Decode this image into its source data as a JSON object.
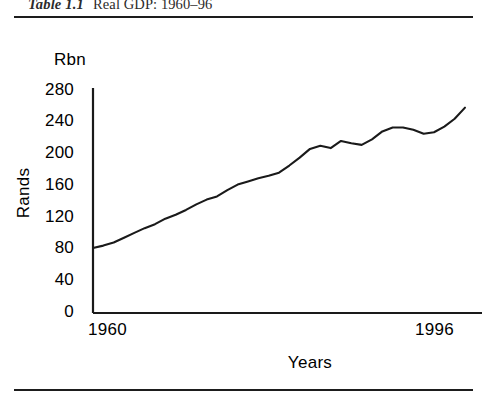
{
  "caption": {
    "label": "Table 1.1",
    "title": "Real GDP: 1960–96"
  },
  "chart_data": {
    "type": "line",
    "title": "Real GDP: 1960–96",
    "unit_label": "Rbn",
    "xlabel": "Years",
    "ylabel": "Rands",
    "xlim": [
      1960,
      1996
    ],
    "ylim": [
      0,
      280
    ],
    "yticks": [
      0,
      40,
      80,
      120,
      160,
      200,
      240,
      280
    ],
    "xticks": [
      1960,
      1996
    ],
    "xtick_labels": [
      "1960",
      "1996"
    ],
    "grid": false,
    "legend": false,
    "series": [
      {
        "name": "Real GDP",
        "color": "#1a1a1a",
        "x": [
          1960,
          1961,
          1962,
          1963,
          1964,
          1965,
          1966,
          1967,
          1968,
          1969,
          1970,
          1971,
          1972,
          1973,
          1974,
          1975,
          1976,
          1977,
          1978,
          1979,
          1980,
          1981,
          1982,
          1983,
          1984,
          1985,
          1986,
          1987,
          1988,
          1989,
          1990,
          1991,
          1992,
          1993,
          1994,
          1995,
          1996
        ],
        "values": [
          82,
          85,
          89,
          95,
          101,
          107,
          112,
          119,
          124,
          130,
          137,
          143,
          147,
          155,
          162,
          166,
          170,
          173,
          177,
          186,
          196,
          207,
          211,
          208,
          217,
          214,
          212,
          219,
          229,
          234,
          234,
          231,
          226,
          228,
          235,
          245,
          259
        ]
      }
    ]
  },
  "axis": {
    "ytick_labels": [
      "280",
      "240",
      "200",
      "160",
      "120",
      "80",
      "40",
      "0"
    ]
  }
}
